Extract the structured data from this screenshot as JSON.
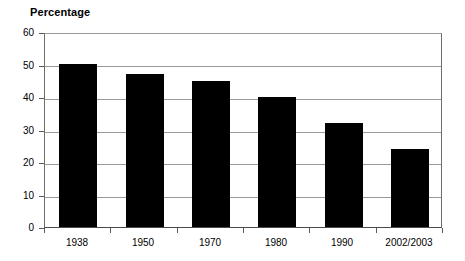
{
  "chart_data": {
    "type": "bar",
    "title": "Percentage",
    "xlabel": "",
    "ylabel": "Percentage",
    "categories": [
      "1938",
      "1950",
      "1970",
      "1980",
      "1990",
      "2002/2003"
    ],
    "values": [
      50,
      47,
      45,
      40,
      32,
      24
    ],
    "ylim": [
      0,
      60
    ],
    "ytick_values": [
      0,
      10,
      20,
      30,
      40,
      50,
      60
    ],
    "ytick_labels": [
      "0",
      "10",
      "20",
      "30",
      "40",
      "50",
      "60"
    ],
    "grid": true,
    "legend": false,
    "legend_position": "none",
    "series": [
      {
        "name": "Percentage",
        "values": [
          50,
          47,
          45,
          40,
          32,
          24
        ],
        "color": "#000000"
      }
    ],
    "colors": {
      "bar": "#000000",
      "grid": "#9a9a9a",
      "axis": "#4a4a4a",
      "background": "#ffffff",
      "text": "#000000"
    }
  }
}
